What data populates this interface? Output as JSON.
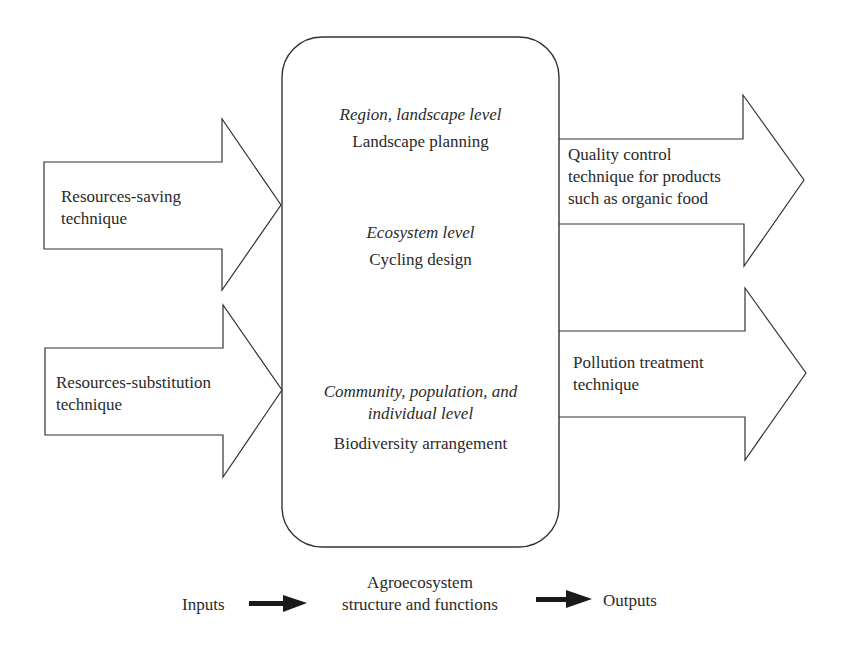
{
  "inputs": [
    {
      "label_line1": "Resources-saving",
      "label_line2": "technique"
    },
    {
      "label_line1": "Resources-substitution",
      "label_line2": "technique"
    }
  ],
  "center_box": {
    "levels": [
      {
        "level": "Region, landscape level",
        "practice": "Landscape planning"
      },
      {
        "level": "Ecosystem level",
        "practice": "Cycling design"
      },
      {
        "level_line1": "Community, population, and",
        "level_line2": "individual level",
        "practice": "Biodiversity arrangement"
      }
    ]
  },
  "outputs": [
    {
      "label_line1": "Quality control",
      "label_line2": "technique for products",
      "label_line3": "such as organic food"
    },
    {
      "label_line1": "Pollution treatment",
      "label_line2": "technique"
    }
  ],
  "legend": {
    "inputs": "Inputs",
    "middle_line1": "Agroecosystem",
    "middle_line2": "structure and functions",
    "outputs": "Outputs"
  },
  "colors": {
    "stroke": "#333333",
    "fill": "#ffffff",
    "legend_arrow": "#1a1a1a"
  }
}
